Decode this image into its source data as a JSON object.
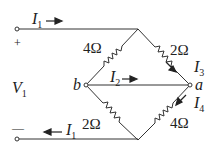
{
  "diagram": {
    "type": "bridge-circuit",
    "source": {
      "label": "V",
      "subscript": "1",
      "plus": "+",
      "minus": "—"
    },
    "currents": {
      "top_in": {
        "label": "I",
        "subscript": "1"
      },
      "bottom_out": {
        "label": "I",
        "subscript": "1"
      },
      "bridge": {
        "label": "I",
        "subscript": "2"
      },
      "upper_right": {
        "label": "I",
        "subscript": "3"
      },
      "lower_right": {
        "label": "I",
        "subscript": "4"
      }
    },
    "nodes": {
      "a": "a",
      "b": "b"
    },
    "resistors": {
      "top_left": "4Ω",
      "top_right": "2Ω",
      "bottom_left": "2Ω",
      "bottom_right": "4Ω"
    }
  }
}
